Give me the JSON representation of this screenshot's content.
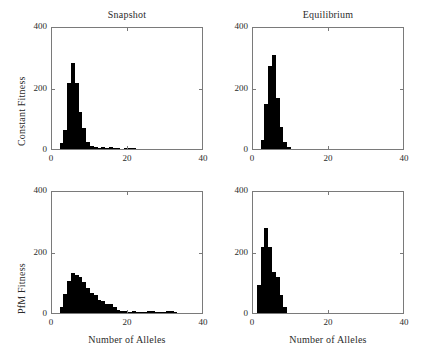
{
  "figure": {
    "background_color": "#ffffff",
    "bar_color": "#000000",
    "axis_color": "#7a7a7a",
    "column_titles": [
      "Snapshot",
      "Equilibrium"
    ],
    "row_labels": [
      "Constant Fitness",
      "PfM Fitness"
    ],
    "xlabel": "Number of Alleles",
    "xticks": [
      "0",
      "20",
      "40"
    ],
    "yticks": [
      "0",
      "200",
      "400"
    ]
  },
  "chart_data": [
    {
      "type": "bar",
      "title": "Snapshot",
      "panel": "top-left",
      "row_label": "Constant Fitness",
      "xlabel": "Number of Alleles",
      "ylabel": "Constant Fitness",
      "xlim": [
        0,
        40
      ],
      "ylim": [
        0,
        400
      ],
      "xticks": [
        0,
        20,
        40
      ],
      "yticks": [
        0,
        200,
        400
      ],
      "grid": false,
      "bin_width": 1,
      "x": [
        1,
        2,
        3,
        4,
        5,
        6,
        7,
        8,
        9,
        10,
        11,
        12,
        13,
        14,
        15,
        16,
        17,
        18,
        19,
        20,
        21,
        22,
        23,
        24,
        25,
        26,
        27,
        28,
        29,
        30,
        31,
        32,
        33,
        34,
        35,
        36,
        37,
        38,
        39
      ],
      "values": [
        0,
        18,
        62,
        215,
        280,
        215,
        120,
        68,
        22,
        10,
        5,
        4,
        8,
        4,
        8,
        2,
        2,
        0,
        2,
        4,
        2,
        0,
        0,
        0,
        0,
        0,
        0,
        0,
        0,
        0,
        0,
        0,
        0,
        0,
        0,
        0,
        0,
        0,
        0
      ]
    },
    {
      "type": "bar",
      "title": "Equilibrium",
      "panel": "top-right",
      "row_label": "Constant Fitness",
      "xlabel": "Number of Alleles",
      "ylabel": "Constant Fitness",
      "xlim": [
        0,
        40
      ],
      "ylim": [
        0,
        400
      ],
      "xticks": [
        0,
        20,
        40
      ],
      "yticks": [
        0,
        200,
        400
      ],
      "grid": false,
      "bin_width": 1,
      "x": [
        1,
        2,
        3,
        4,
        5,
        6,
        7,
        8,
        9,
        10,
        11,
        12,
        13,
        14,
        15,
        16,
        17,
        18,
        19,
        20,
        21,
        22,
        23,
        24,
        25,
        26,
        27,
        28,
        29,
        30,
        31,
        32,
        33,
        34,
        35,
        36,
        37,
        38,
        39
      ],
      "values": [
        0,
        30,
        145,
        270,
        305,
        165,
        70,
        22,
        6,
        0,
        0,
        0,
        0,
        0,
        0,
        0,
        0,
        0,
        0,
        0,
        0,
        0,
        0,
        0,
        0,
        0,
        0,
        0,
        0,
        0,
        0,
        0,
        0,
        0,
        0,
        0,
        0,
        0,
        0
      ]
    },
    {
      "type": "bar",
      "title": "Snapshot",
      "panel": "bottom-left",
      "row_label": "PfM Fitness",
      "xlabel": "Number of Alleles",
      "ylabel": "PfM Fitness",
      "xlim": [
        0,
        40
      ],
      "ylim": [
        0,
        400
      ],
      "xticks": [
        0,
        20,
        40
      ],
      "yticks": [
        0,
        200,
        400
      ],
      "grid": false,
      "bin_width": 1,
      "x": [
        1,
        2,
        3,
        4,
        5,
        6,
        7,
        8,
        9,
        10,
        11,
        12,
        13,
        14,
        15,
        16,
        17,
        18,
        19,
        20,
        21,
        22,
        23,
        24,
        25,
        26,
        27,
        28,
        29,
        30,
        31,
        32,
        33,
        34,
        35,
        36,
        37,
        38,
        39
      ],
      "values": [
        0,
        20,
        62,
        105,
        130,
        125,
        118,
        100,
        82,
        66,
        58,
        42,
        40,
        28,
        30,
        20,
        10,
        6,
        5,
        4,
        8,
        4,
        2,
        2,
        5,
        5,
        2,
        4,
        4,
        5,
        5,
        2,
        0,
        0,
        0,
        0,
        0,
        0,
        0
      ]
    },
    {
      "type": "bar",
      "title": "Equilibrium",
      "panel": "bottom-right",
      "row_label": "PfM Fitness",
      "xlabel": "Number of Alleles",
      "ylabel": "PfM Fitness",
      "xlim": [
        0,
        40
      ],
      "ylim": [
        0,
        400
      ],
      "xticks": [
        0,
        20,
        40
      ],
      "yticks": [
        0,
        200,
        400
      ],
      "grid": false,
      "bin_width": 1,
      "x": [
        1,
        2,
        3,
        4,
        5,
        6,
        7,
        8,
        9,
        10,
        11,
        12,
        13,
        14,
        15,
        16,
        17,
        18,
        19,
        20,
        21,
        22,
        23,
        24,
        25,
        26,
        27,
        28,
        29,
        30,
        31,
        32,
        33,
        34,
        35,
        36,
        37,
        38,
        39
      ],
      "values": [
        90,
        215,
        275,
        215,
        135,
        118,
        60,
        18,
        0,
        0,
        0,
        0,
        0,
        0,
        0,
        0,
        0,
        0,
        0,
        0,
        0,
        0,
        0,
        0,
        0,
        0,
        0,
        0,
        0,
        0,
        0,
        0,
        0,
        0,
        0,
        0,
        0,
        0,
        0
      ]
    }
  ]
}
